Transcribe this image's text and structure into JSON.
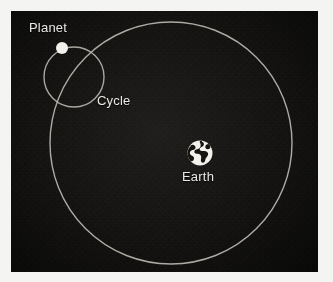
{
  "figure": {
    "background_color": "#100f0e",
    "border_color": "#f4f4f2",
    "stroke_color": "#b9b7b0",
    "label_color": "#e9e8e4",
    "plate": {
      "x": 11,
      "y": 11,
      "width": 307,
      "height": 261
    }
  },
  "labels": {
    "planet": "Planet",
    "cycle": "Cycle",
    "earth": "Earth"
  },
  "chart_data": {
    "type": "scatter",
    "xlabel": "",
    "ylabel": "",
    "xlim": [
      0,
      333
    ],
    "ylim": [
      0,
      282
    ],
    "grid": false,
    "legend": "none",
    "annotations": [
      {
        "text": "Planet",
        "x": 29,
        "y": 28
      },
      {
        "text": "Cycle",
        "x": 97,
        "y": 101
      },
      {
        "text": "Earth",
        "x": 182,
        "y": 177
      }
    ],
    "shapes": [
      {
        "name": "deferent-circle",
        "type": "circle",
        "cx": 171,
        "cy": 143,
        "r": 121,
        "fill": "none",
        "stroke": "#b9b7b0",
        "stroke_width": 1.4
      },
      {
        "name": "epicycle-circle",
        "type": "circle",
        "cx": 74,
        "cy": 77,
        "r": 30,
        "fill": "none",
        "stroke": "#b9b7b0",
        "stroke_width": 1.4
      },
      {
        "name": "planet-dot",
        "type": "circle",
        "cx": 62,
        "cy": 48,
        "r": 6,
        "fill": "#f2f1ec",
        "stroke": "none",
        "stroke_width": 0
      },
      {
        "name": "earth-globe",
        "type": "circle",
        "cx": 200,
        "cy": 153,
        "r": 12.5,
        "fill": "#f2f1ec",
        "stroke": "none",
        "stroke_width": 0
      }
    ]
  }
}
